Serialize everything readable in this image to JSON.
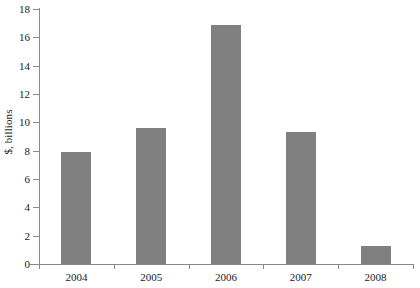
{
  "chart_data": {
    "type": "bar",
    "title": "",
    "subtitle": "",
    "xlabel": "",
    "ylabel": "$, billions",
    "categories": [
      "2004",
      "2005",
      "2006",
      "2007",
      "2008"
    ],
    "values": [
      7.9,
      9.6,
      16.9,
      9.3,
      1.3
    ],
    "ylim": [
      0,
      18
    ],
    "ytick_step": 2,
    "yticks": [
      "0",
      "2",
      "4",
      "6",
      "8",
      "10",
      "12",
      "14",
      "16",
      "18"
    ],
    "grid": false,
    "legend": false,
    "legend_position": "none",
    "bar_color": "#808080",
    "axis_color": "#8a8a8a",
    "text_color": "#1a1a1a"
  }
}
